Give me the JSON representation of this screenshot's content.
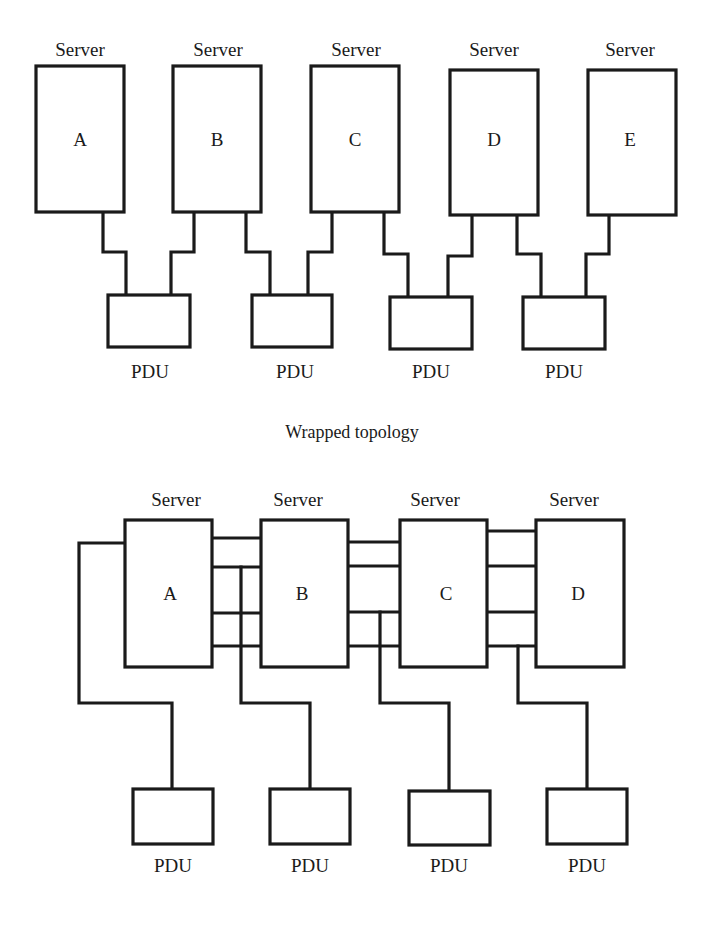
{
  "top_diagram": {
    "caption": "Wrapped topology",
    "server_label": "Server",
    "pdu_label": "PDU",
    "servers": [
      {
        "id": "A",
        "label": "Server",
        "letter": "A"
      },
      {
        "id": "B",
        "label": "Server",
        "letter": "B"
      },
      {
        "id": "C",
        "label": "Server",
        "letter": "C"
      },
      {
        "id": "D",
        "label": "Server",
        "letter": "D"
      },
      {
        "id": "E",
        "label": "Server",
        "letter": "E"
      }
    ],
    "pdus": [
      {
        "label": "PDU",
        "connects": [
          "A",
          "B"
        ]
      },
      {
        "label": "PDU",
        "connects": [
          "B",
          "C"
        ]
      },
      {
        "label": "PDU",
        "connects": [
          "C",
          "D"
        ]
      },
      {
        "label": "PDU",
        "connects": [
          "D",
          "E"
        ]
      }
    ]
  },
  "bottom_diagram": {
    "caption": "",
    "server_label": "Server",
    "pdu_label": "PDU",
    "servers": [
      {
        "id": "A",
        "label": "Server",
        "letter": "A"
      },
      {
        "id": "B",
        "label": "Server",
        "letter": "B"
      },
      {
        "id": "C",
        "label": "Server",
        "letter": "C"
      },
      {
        "id": "D",
        "label": "Server",
        "letter": "D"
      }
    ],
    "pdus": [
      {
        "label": "PDU"
      },
      {
        "label": "PDU"
      },
      {
        "label": "PDU"
      },
      {
        "label": "PDU"
      }
    ],
    "links": "4 parallel horizontal connections between each adjacent server pair; each PDU fed by a single vertical line dropping from the server interconnect"
  },
  "colors": {
    "line": "#1a1a1a",
    "background": "#ffffff"
  }
}
